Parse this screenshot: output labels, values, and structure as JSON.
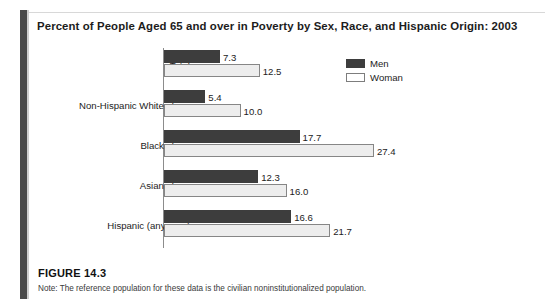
{
  "figure": {
    "title": "Percent of People Aged 65 and over in Poverty by Sex, Race, and Hispanic Origin: 2003",
    "number_label": "FIGURE 14.3",
    "note": "Note: The reference population for these data is the civilian noninstitutionalized population."
  },
  "legend": {
    "position": "top-right",
    "items": [
      {
        "label": "Men",
        "color": "#3d3d3d",
        "icon": "filled-square-swatch"
      },
      {
        "label": "Woman",
        "color": "#ffffff",
        "icon": "outlined-square-swatch"
      }
    ]
  },
  "chart_data": {
    "type": "bar",
    "orientation": "horizontal",
    "title": "Percent of People Aged 65 and over in Poverty by Sex, Race, and Hispanic Origin: 2003",
    "xlabel": "",
    "ylabel": "",
    "xlim": [
      0,
      27.4
    ],
    "grid": false,
    "legend_position": "top-right",
    "categories": [
      "Total",
      "Non-Hispanic White alone",
      "Black alone",
      "Asian alone",
      "Hispanic (any race)"
    ],
    "series": [
      {
        "name": "Men",
        "values": [
          7.3,
          5.4,
          17.7,
          12.3,
          16.6
        ]
      },
      {
        "name": "Woman",
        "values": [
          12.5,
          10.0,
          27.4,
          16.0,
          21.7
        ]
      }
    ],
    "value_labels": {
      "Men": [
        "7.3",
        "5.4",
        "17.7",
        "12.3",
        "16.6"
      ],
      "Woman": [
        "12.5",
        "10.0",
        "27.4",
        "16.0",
        "21.7"
      ]
    }
  },
  "layout": {
    "axis_x": 135,
    "px_per_unit": 7.66,
    "bar_height": 13,
    "group_tops": [
      2,
      42,
      82,
      122,
      162
    ]
  }
}
